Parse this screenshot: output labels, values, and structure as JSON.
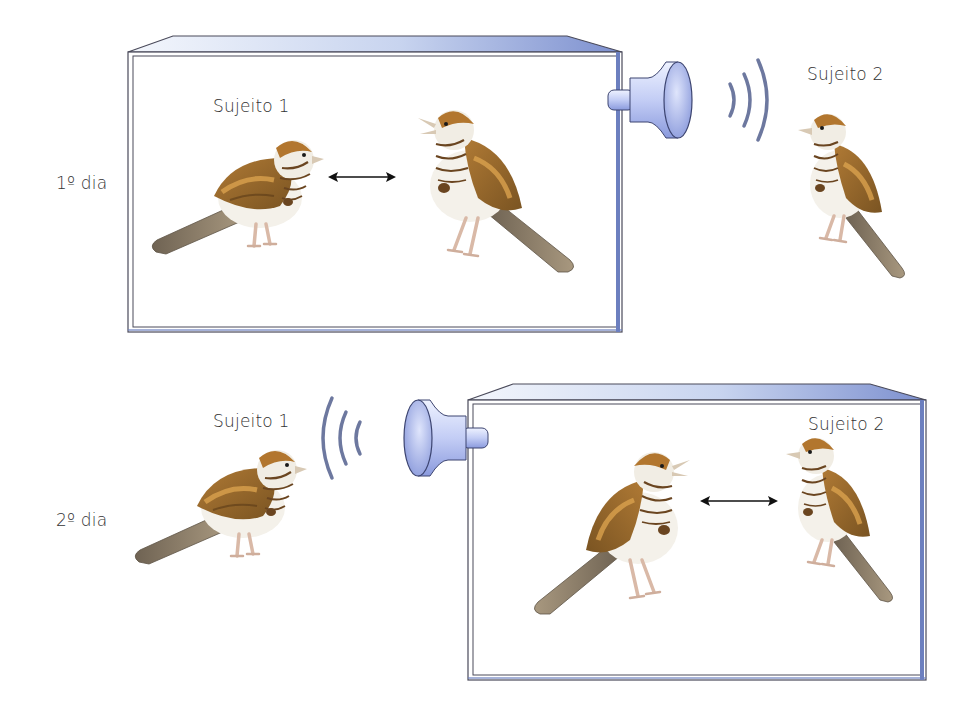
{
  "rows": [
    {
      "day_label": "1º dia",
      "subject1_label": "Sujeito 1",
      "subject2_label": "Sujeito 2",
      "box_contains": [
        "Sujeito 1",
        "Sujeito 2 (playback)"
      ],
      "speaker_side": "right",
      "interaction": "bidirectional-arrow"
    },
    {
      "day_label": "2º dia",
      "subject1_label": "Sujeito 1",
      "subject2_label": "Sujeito 2",
      "box_contains": [
        "Sujeito 1 (playback)",
        "Sujeito 2"
      ],
      "speaker_side": "left",
      "interaction": "bidirectional-arrow"
    }
  ],
  "icons": {
    "speaker": "speaker-horn-icon",
    "sound_waves": "sound-waves-icon",
    "arrow": "double-headed-arrow-icon",
    "bird": "sparrow-illustration"
  },
  "colors": {
    "box_face_light": "#e4ecf8",
    "box_face_dark": "#7f92cc",
    "box_stroke": "#4a4a5a",
    "box_side": "#6c7fbf",
    "speaker_light": "#dfe6fb",
    "speaker_dark": "#8f9fe0",
    "wave": "#53608e",
    "bird_back": "#9a6a2a",
    "bird_belly": "#f4f1ea",
    "bird_tail": "#8d7f6c",
    "bird_crown": "#b2762e",
    "text": "#333333"
  }
}
